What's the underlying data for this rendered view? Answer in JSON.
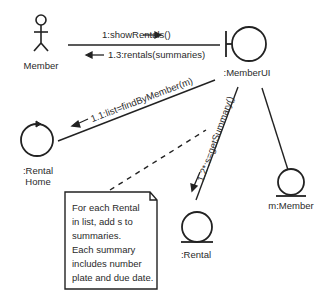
{
  "diagram": {
    "type": "UML communication diagram",
    "objects": {
      "member_actor": {
        "label": "Member",
        "kind": "actor"
      },
      "member_ui": {
        "label": ":MemberUI",
        "kind": "boundary"
      },
      "rental_home": {
        "label_line1": ":Rental",
        "label_line2": "Home",
        "kind": "control"
      },
      "rental": {
        "label": ":Rental",
        "kind": "entity"
      },
      "m_member": {
        "label": "m:Member",
        "kind": "entity"
      }
    },
    "messages": {
      "msg_1": {
        "label": "1:showRentals()",
        "direction": "right"
      },
      "msg_1_3": {
        "label": "1.3:rentals(summaries)",
        "direction": "left"
      },
      "msg_1_1": {
        "label": "1.1:list=findByMember(m)",
        "direction": "down-left"
      },
      "msg_1_2": {
        "label": "1.2*:s=getSummary()",
        "direction": "down"
      }
    },
    "note": {
      "lines": [
        "For each Rental",
        "in list, add s to",
        "summaries.",
        "Each summary",
        "includes number",
        "plate and due date."
      ]
    },
    "colors": {
      "stroke": "#222222",
      "text": "#2a2a2a",
      "background": "#ffffff"
    }
  }
}
